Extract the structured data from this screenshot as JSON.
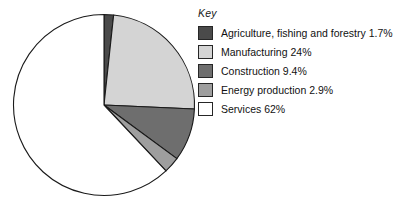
{
  "legend": {
    "title": "Key",
    "position": "right"
  },
  "chart_data": {
    "type": "pie",
    "title": "",
    "xlabel": "",
    "ylabel": "",
    "start_angle_deg": 0,
    "direction": "clockwise",
    "units": "percent",
    "total": 100,
    "slices": [
      {
        "label": "Agriculture, fishing and forestry",
        "value": 1.7,
        "display": "Agriculture, fishing and forestry 1.7%",
        "color": "#4a4a4a"
      },
      {
        "label": "Manufacturing",
        "value": 24,
        "display": "Manufacturing 24%",
        "color": "#d4d4d4"
      },
      {
        "label": "Construction",
        "value": 9.4,
        "display": "Construction 9.4%",
        "color": "#6e6e6e"
      },
      {
        "label": "Energy production",
        "value": 2.9,
        "display": "Energy production 2.9%",
        "color": "#9e9e9e"
      },
      {
        "label": "Services",
        "value": 62,
        "display": "Services 62%",
        "color": "#ffffff"
      }
    ],
    "stroke_color": "#1a1a1a",
    "background": "#ffffff"
  }
}
